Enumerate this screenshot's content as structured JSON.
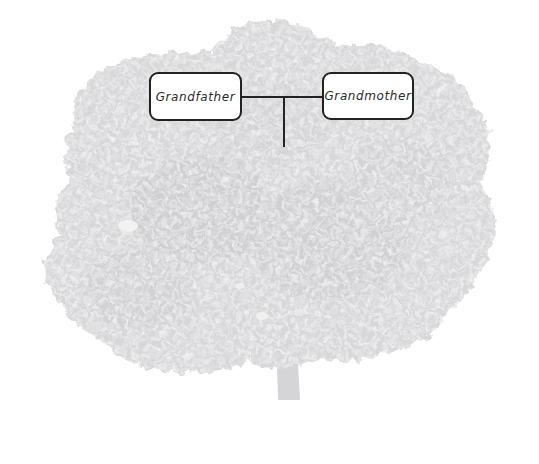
{
  "diagram": {
    "type": "family-tree",
    "background": {
      "image": "tree-silhouette",
      "color": "#d7d7d9"
    },
    "nodes": [
      {
        "id": "grandfather",
        "label": "Grandfather",
        "x": 149,
        "y": 72,
        "w": 93,
        "h": 49
      },
      {
        "id": "grandmother",
        "label": "Grandmother",
        "x": 322,
        "y": 72,
        "w": 92,
        "h": 48
      }
    ],
    "connectors": [
      {
        "from": "grandfather",
        "to": "grandmother",
        "type": "marriage-line"
      },
      {
        "from": "marriage-line",
        "to": "children",
        "type": "descent-line"
      }
    ],
    "colors": {
      "line": "#222222",
      "box_fill": "#ffffff",
      "box_border": "#222222",
      "text": "#2a2a2a"
    }
  }
}
